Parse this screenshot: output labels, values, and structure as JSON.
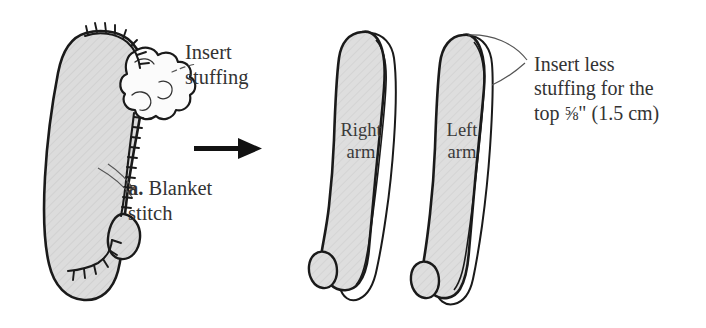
{
  "illustration": {
    "title": "Sewing instructions: stuffing knitted arms",
    "background_color": "#ffffff",
    "ink_color": "#1a1a1a",
    "fill_color": "#d9d9d9"
  },
  "labels": {
    "insert_stuffing": "Insert\nstuffing",
    "insert_stuffing_line1": "Insert",
    "insert_stuffing_line2": "stuffing",
    "blanket_marker": "a.",
    "blanket_text": " Blanket stitch",
    "blanket_line1": "Blanket",
    "blanket_line2": "stitch",
    "right_arm_line1": "Right",
    "right_arm_line2": "arm",
    "left_arm_line1": "Left",
    "left_arm_line2": "arm",
    "insert_less_line1": "Insert less",
    "insert_less_line2": "stuffing for the",
    "insert_less_line3_pre": "top ",
    "insert_less_fraction": "⅝",
    "insert_less_line3_post": "\" (1.5 cm)"
  },
  "figures": {
    "left_arm_stitched": {
      "name": "arm-with-blanket-stitch",
      "has_stuffing_cloud": true,
      "stitch_type": "blanket stitch"
    },
    "right_arm": {
      "name": "right-arm",
      "label": "Right arm"
    },
    "left_arm": {
      "name": "left-arm",
      "label": "Left arm"
    },
    "arrow": {
      "name": "process-arrow",
      "direction": "right"
    }
  }
}
